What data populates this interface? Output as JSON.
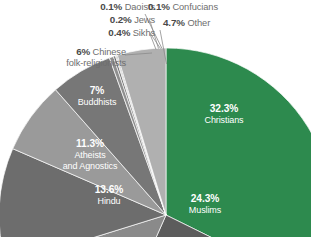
{
  "chart_data": {
    "type": "pie",
    "title": "",
    "subtitle": "",
    "xlabel": "",
    "ylabel": "",
    "legend_position": "callout-labels",
    "grid": false,
    "units": "percent",
    "categories": [
      "Christians",
      "Muslims",
      "Hindu",
      "Atheists and Agnostics",
      "Buddhists",
      "Chinese folk-religionists",
      "Sikhs",
      "Jews",
      "Daoists",
      "Confucians",
      "Other"
    ],
    "values": [
      32.3,
      24.3,
      13.6,
      11.3,
      7.0,
      6.0,
      0.4,
      0.2,
      0.1,
      0.1,
      4.7
    ],
    "colors": [
      "#2d8a4e",
      "#5c5c5c",
      "#8a8a8a",
      "#6d6d6d",
      "#9a9a9a",
      "#777777",
      "#8f8f8f",
      "#6b6b6b",
      "#a2a2a2",
      "#7e7e7e",
      "#b0b0b0"
    ],
    "slices": [
      {
        "name": "Christians",
        "pct": "32.3%",
        "value": 32.3,
        "color": "#2d8a4e",
        "label_placement": "inside"
      },
      {
        "name": "Muslims",
        "pct": "24.3%",
        "value": 24.3,
        "color": "#5c5c5c",
        "label_placement": "inside"
      },
      {
        "name": "Hindu",
        "pct": "13.6%",
        "value": 13.6,
        "color": "#8a8a8a",
        "label_placement": "inside"
      },
      {
        "name": "Atheists and Agnostics",
        "pct": "11.3%",
        "value": 11.3,
        "color": "#6d6d6d",
        "label_placement": "inside"
      },
      {
        "name": "Buddhists",
        "pct": "7%",
        "value": 7.0,
        "color": "#9a9a9a",
        "label_placement": "inside"
      },
      {
        "name": "Chinese folk-religionists",
        "pct": "6%",
        "value": 6.0,
        "color": "#777777",
        "label_placement": "callout"
      },
      {
        "name": "Sikhs",
        "pct": "0.4%",
        "value": 0.4,
        "color": "#8f8f8f",
        "label_placement": "callout"
      },
      {
        "name": "Jews",
        "pct": "0.2%",
        "value": 0.2,
        "color": "#6b6b6b",
        "label_placement": "callout"
      },
      {
        "name": "Daoists",
        "pct": "0.1%",
        "value": 0.1,
        "color": "#a2a2a2",
        "label_placement": "callout"
      },
      {
        "name": "Confucians",
        "pct": "0.1%",
        "value": 0.1,
        "color": "#7e7e7e",
        "label_placement": "callout"
      },
      {
        "name": "Other",
        "pct": "4.7%",
        "value": 4.7,
        "color": "#b0b0b0",
        "label_placement": "callout"
      }
    ]
  },
  "labels": {
    "daoists": {
      "pct": "0.1%",
      "name": "Daoists"
    },
    "jews": {
      "pct": "0.2%",
      "name": "Jews"
    },
    "sikhs": {
      "pct": "0.4%",
      "name": "Sikhs"
    },
    "confucians": {
      "pct": "0.1%",
      "name": "Confucians"
    },
    "other": {
      "pct": "4.7%",
      "name": "Other"
    },
    "chinese": {
      "pct": "6%",
      "name": "Chinese",
      "name2": "folk-religionists"
    },
    "buddhists": {
      "pct": "7%",
      "name": "Buddhists"
    },
    "atheists": {
      "pct": "11.3%",
      "name": "Atheists",
      "name2": "and Agnostics"
    },
    "hindu": {
      "pct": "13.6%",
      "name": "Hindu"
    },
    "muslims": {
      "pct": "24.3%",
      "name": "Muslims"
    },
    "christians": {
      "pct": "32.3%",
      "name": "Christians"
    }
  }
}
